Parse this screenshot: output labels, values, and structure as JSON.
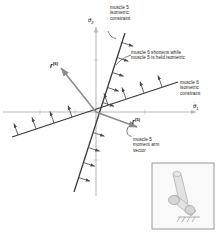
{
  "figure": {
    "background": "#ffffff",
    "axes": {
      "color": "#b9b9b9",
      "horizontal_label": "θ̇1",
      "vertical_label": "θ̇2",
      "horizontal_label_base": "θ",
      "horizontal_label_sub": "1",
      "vertical_label_base": "θ",
      "vertical_label_sub": "2"
    },
    "vectors": [
      {
        "name": "r6",
        "base": "r",
        "sup": "(6)",
        "label": "r(6)",
        "color": "#8a8a8a"
      },
      {
        "name": "r5",
        "base": "r",
        "sup": "(5)",
        "label": "r(5)",
        "color": "#8a8a8a"
      }
    ],
    "constraints": [
      {
        "name": "muscle-5-constraint",
        "color": "#3a3a3a"
      },
      {
        "name": "muscle-6-constraint",
        "color": "#3a3a3a"
      }
    ],
    "annotations": {
      "muscle5_isometric": "muscle 5\nisometric\nconstraint",
      "muscle6_shortens": "muscle 6 shortens while\nmuscle 5 is held isometric",
      "muscle6_isometric": "muscle 6\nisometric\nconstraint",
      "muscle5_moment_arm": "muscle 5\nmoment arm\nvector"
    },
    "inset": {
      "name": "limb-linkage-inset",
      "border_color": "#a0a0a0",
      "fill": "#f7f7f7",
      "limb_color": "#c8c8c8"
    }
  }
}
